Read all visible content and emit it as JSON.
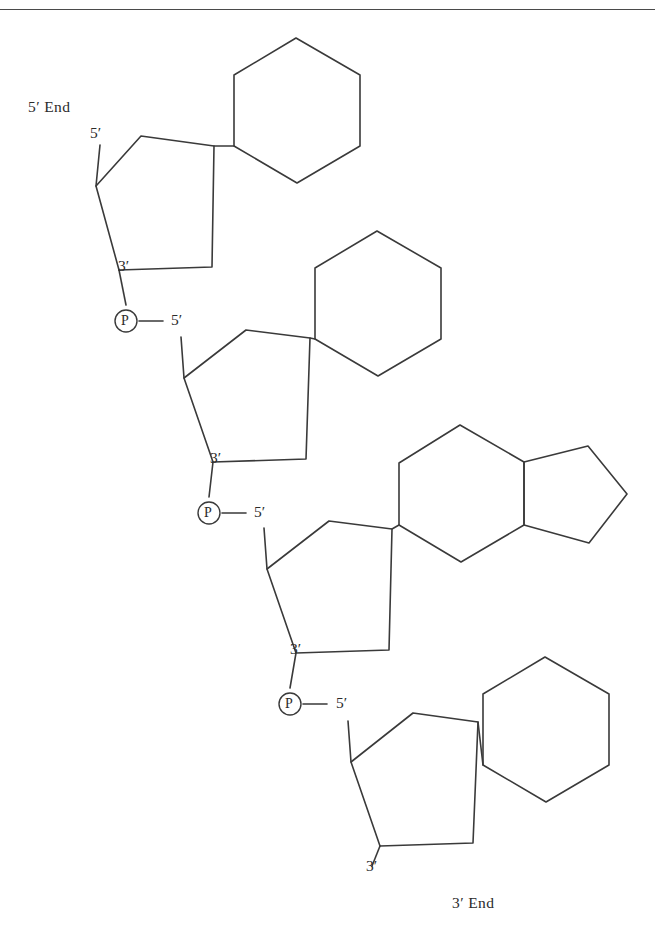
{
  "figure": {
    "stroke_color": "#3a3a3a",
    "background_color": "#ffffff",
    "rule_color": "#4a4a4a"
  },
  "labels": {
    "five_prime_end": "5′ End",
    "three_prime_end": "3′ End",
    "phosphate_symbol": "P",
    "five_prime": "5′",
    "three_prime": "3′"
  },
  "units": [
    {
      "id": "nucleotide-1",
      "sugar": "pentagon-ribose",
      "base": "hexagon-pyrimidine",
      "five_prime_label": "5′",
      "three_prime_label": "3′",
      "end_label": "5′ End"
    },
    {
      "id": "nucleotide-2",
      "sugar": "pentagon-ribose",
      "base": "hexagon-pyrimidine",
      "five_prime_label": "5′",
      "three_prime_label": "3′",
      "end_label": ""
    },
    {
      "id": "nucleotide-3",
      "sugar": "pentagon-ribose",
      "base": "fused-hexagon-pentagon-purine",
      "five_prime_label": "5′",
      "three_prime_label": "3′",
      "end_label": ""
    },
    {
      "id": "nucleotide-4",
      "sugar": "pentagon-ribose",
      "base": "hexagon-pyrimidine",
      "five_prime_label": "5′",
      "three_prime_label": "3′",
      "end_label": "3′ End"
    }
  ],
  "phosphates": [
    {
      "id": "phosphate-1",
      "symbol": "P",
      "links": "3′ of unit 1 to 5′ of unit 2"
    },
    {
      "id": "phosphate-2",
      "symbol": "P",
      "links": "3′ of unit 2 to 5′ of unit 3"
    },
    {
      "id": "phosphate-3",
      "symbol": "P",
      "links": "3′ of unit 3 to 5′ of unit 4"
    }
  ]
}
